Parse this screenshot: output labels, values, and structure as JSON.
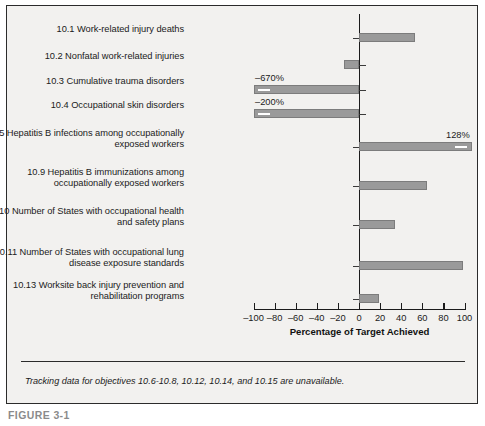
{
  "figure": {
    "footnote": "Tracking data for objectives 10.6-10.8, 10.12, 10.14, and 10.15 are unavailable.",
    "caption": "FIGURE 3-1",
    "frame_color": "#2b2b2b",
    "panel_color": "#f2f1ef",
    "bar_color": "#9a9a9a"
  },
  "chart_data": {
    "type": "bar",
    "orientation": "horizontal",
    "title": "",
    "xlabel": "Percentage of Target Achieved",
    "ylabel": "",
    "xlim": [
      -100,
      100
    ],
    "xticks": [
      -100,
      -80,
      -60,
      -40,
      -20,
      0,
      20,
      40,
      60,
      80,
      100
    ],
    "xticklabels": [
      "–100",
      "–80",
      "–60",
      "–40",
      "–20",
      "0",
      "20",
      "40",
      "60",
      "80",
      "100"
    ],
    "grid": false,
    "legend": null,
    "categories": [
      "10.1 Work-related injury deaths",
      "10.2 Nonfatal work-related injuries",
      "10.3 Cumulative trauma disorders",
      "10.4 Occupational skin disorders",
      "10.5 Hepatitis B infections among occupationally exposed workers",
      "10.9 Hepatitis B immunizations among occupationally exposed workers",
      "10.10 Number of States with occupational health and safety plans",
      "10.11 Number of States with occupational lung disease exposure standards",
      "10.13 Worksite back injury prevention and rehabilitation programs"
    ],
    "values": [
      53,
      -14,
      -670,
      -200,
      128,
      64,
      34,
      99,
      19
    ],
    "annotations": [
      {
        "category": "10.3 Cumulative trauma disorders",
        "text": "–670%"
      },
      {
        "category": "10.4 Occupational skin disorders",
        "text": "–200%"
      },
      {
        "category": "10.5 Hepatitis B infections among occupationally exposed workers",
        "text": "128%"
      }
    ],
    "clipped_bars": [
      "10.3 Cumulative trauma disorders",
      "10.4 Occupational skin disorders",
      "10.5 Hepatitis B infections among occupationally exposed workers"
    ]
  },
  "rows": [
    {
      "label_line1": "10.1 Work-related injury deaths",
      "label_line2": "",
      "value": 53,
      "value_text": ""
    },
    {
      "label_line1": "10.2 Nonfatal work-related injuries",
      "label_line2": "",
      "value": -14,
      "value_text": ""
    },
    {
      "label_line1": "10.3 Cumulative trauma disorders",
      "label_line2": "",
      "value": -670,
      "value_text": "–670%"
    },
    {
      "label_line1": "10.4 Occupational skin disorders",
      "label_line2": "",
      "value": -200,
      "value_text": "–200%"
    },
    {
      "label_line1": "10.5 Hepatitis B infections among occupationally",
      "label_line2": "exposed workers",
      "value": 128,
      "value_text": "128%"
    },
    {
      "label_line1": "10.9 Hepatitis B immunizations among",
      "label_line2": "occupationally exposed workers",
      "value": 64,
      "value_text": ""
    },
    {
      "label_line1": "10.10 Number of States with occupational health",
      "label_line2": "and safety plans",
      "value": 34,
      "value_text": ""
    },
    {
      "label_line1": "10.11 Number of States with occupational lung",
      "label_line2": "disease exposure standards",
      "value": 99,
      "value_text": ""
    },
    {
      "label_line1": "10.13 Worksite back injury prevention and",
      "label_line2": "rehabilitation programs",
      "value": 19,
      "value_text": ""
    }
  ]
}
